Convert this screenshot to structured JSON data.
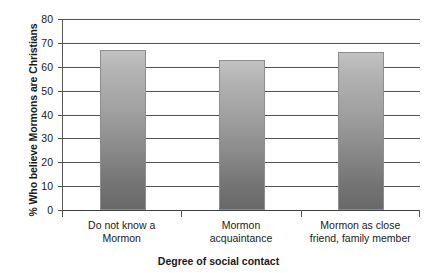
{
  "chart_data": {
    "type": "bar",
    "title": "",
    "categories": [
      "Do not know a\nMormon",
      "Mormon\nacquaintance",
      "Mormon as close\nfriend, family member"
    ],
    "category_lines": [
      [
        "Do not know a",
        "Mormon"
      ],
      [
        "Mormon",
        "acquaintance"
      ],
      [
        "Mormon as close",
        "friend, family member"
      ]
    ],
    "values": [
      67,
      63,
      66
    ],
    "xlabel": "Degree of social contact",
    "ylabel": "% Who believe Mormons are Christians",
    "ylim": [
      0,
      80
    ],
    "ytick_step": 10,
    "yticks": [
      "80",
      "70",
      "60",
      "50",
      "40",
      "30",
      "20",
      "10",
      "0"
    ],
    "grid": true,
    "legend": "none",
    "bar_color_top": "#c2c2c2",
    "bar_color_bottom": "#686868",
    "axis_color": "#4e5255",
    "background": "#ffffff"
  }
}
